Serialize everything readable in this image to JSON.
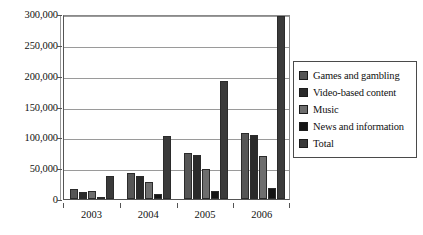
{
  "chart_data": {
    "type": "bar",
    "title": "",
    "subtitle": "",
    "xlabel": "",
    "ylabel": "",
    "categories": [
      "2003",
      "2004",
      "2005",
      "2006"
    ],
    "ylim": [
      0,
      300000
    ],
    "ytick_values": [
      0,
      50000,
      100000,
      150000,
      200000,
      250000,
      300000
    ],
    "ytick_labels": [
      "0",
      "50,000",
      "100,000",
      "150,000",
      "200,000",
      "250,000",
      "300,000"
    ],
    "grid": true,
    "legend_position": "right",
    "series": [
      {
        "name": "Games and gambling",
        "color": "#565656",
        "values": [
          17000,
          42000,
          75000,
          107000
        ]
      },
      {
        "name": "Video-based content",
        "color": "#2a2a2a",
        "values": [
          12000,
          38000,
          72000,
          103000
        ]
      },
      {
        "name": "Music",
        "color": "#6e6e6e",
        "values": [
          13000,
          28000,
          48000,
          70000
        ]
      },
      {
        "name": "News and information",
        "color": "#141414",
        "values": [
          3000,
          8000,
          13000,
          18000
        ]
      },
      {
        "name": "Total",
        "color": "#3a3a3a",
        "values": [
          37000,
          102000,
          192000,
          297000
        ]
      }
    ]
  }
}
